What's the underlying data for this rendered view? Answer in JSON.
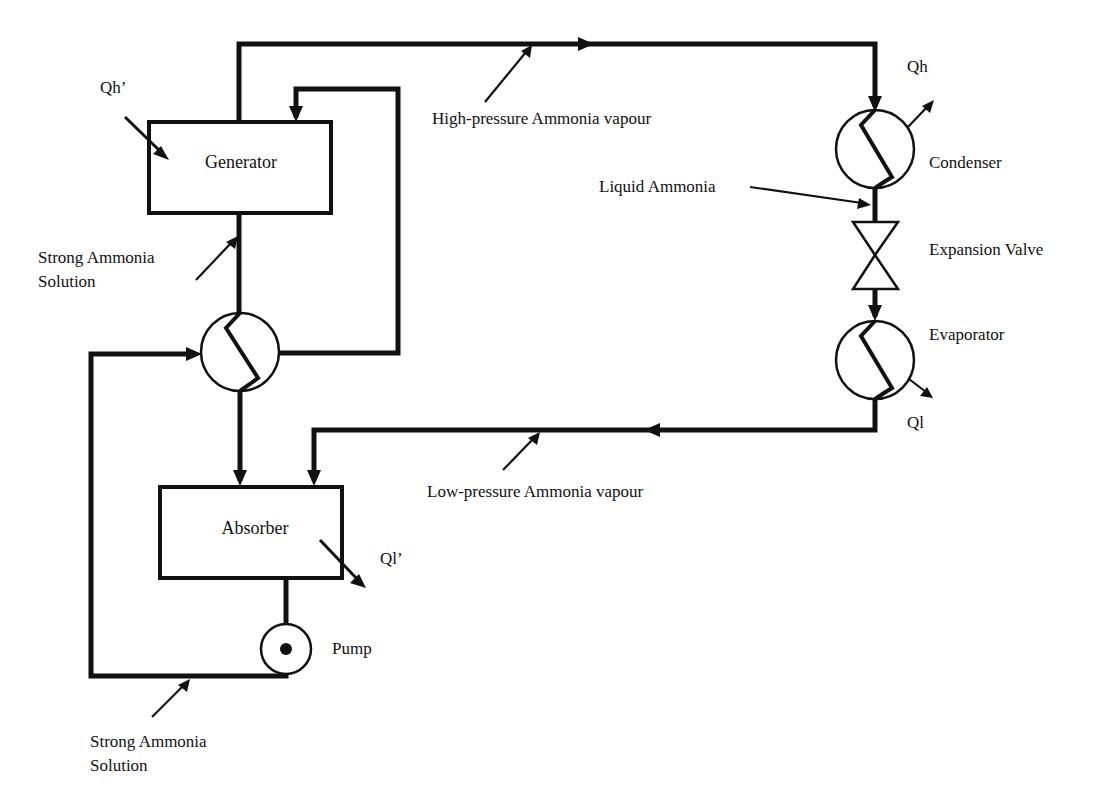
{
  "diagram": {
    "components": {
      "generator": "Generator",
      "absorber": "Absorber",
      "condenser": "Condenser",
      "expansion_valve": "Expansion Valve",
      "evaporator": "Evaporator",
      "pump": "Pump"
    },
    "heat_flows": {
      "generator_in": "Qh’",
      "condenser_out": "Qh",
      "evaporator_out": "Ql",
      "absorber_out": "Ql’"
    },
    "streams": {
      "high_pressure_vapour": "High-pressure Ammonia vapour",
      "liquid_ammonia": "Liquid Ammonia",
      "low_pressure_vapour": "Low-pressure Ammonia vapour",
      "strong_solution_upper_line1": "Strong Ammonia",
      "strong_solution_upper_line2": "Solution",
      "strong_solution_lower_line1": "Strong Ammonia",
      "strong_solution_lower_line2": "Solution"
    },
    "colors": {
      "line": "#111111",
      "background": "#ffffff"
    }
  }
}
